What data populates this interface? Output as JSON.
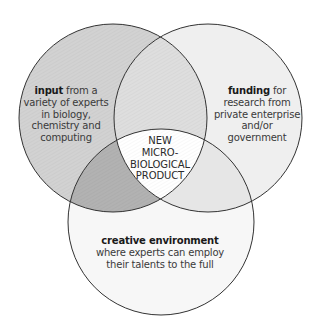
{
  "diagram": {
    "type": "venn-3",
    "circles": [
      {
        "id": "input",
        "cx": 113,
        "cy": 118,
        "r": 94,
        "fill": "#d2d2d2",
        "title": "input",
        "text_lines": [
          "from a",
          "variety of experts",
          "in biology,",
          "chemistry and",
          "computing"
        ]
      },
      {
        "id": "funding",
        "cx": 208,
        "cy": 118,
        "r": 94,
        "fill": "#efefef",
        "title": "funding",
        "text_lines": [
          "for",
          "research from",
          "private enterprise",
          "and/or",
          "government"
        ]
      },
      {
        "id": "creative",
        "cx": 161,
        "cy": 222,
        "r": 93,
        "fill": "#f7f7f7",
        "title": "creative environment",
        "text_lines": [
          "where experts can employ",
          "their talents to the full"
        ]
      }
    ],
    "intersections": {
      "input_funding": {
        "fill": "#dedede"
      },
      "input_creative": {
        "fill": "#b2b2b2"
      },
      "funding_creative": {
        "fill": "#e6e6e6"
      },
      "all_three": {
        "fill": "#ffffff",
        "text_lines": [
          "NEW",
          "MICRO-",
          "BIOLOGICAL",
          "PRODUCT"
        ]
      }
    },
    "stroke_color": "#333333"
  }
}
